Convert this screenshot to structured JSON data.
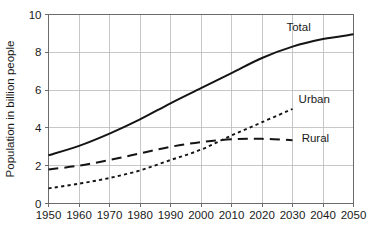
{
  "chart_data": {
    "type": "line",
    "title": "",
    "xlabel": "",
    "ylabel": "Population in billion people",
    "xlim": [
      1950,
      2050
    ],
    "ylim": [
      0,
      10
    ],
    "grid": true,
    "legend_position": "inline-right-of-series",
    "x_ticks": [
      1950,
      1960,
      1970,
      1980,
      1990,
      2000,
      2010,
      2020,
      2030,
      2040,
      2050
    ],
    "y_ticks": [
      0,
      2,
      4,
      6,
      8,
      10
    ],
    "x_tick_labels": [
      "1950",
      "1960",
      "1970",
      "1980",
      "1990",
      "2000",
      "2010",
      "2020",
      "2030",
      "2040",
      "2050"
    ],
    "y_tick_labels": [
      "0",
      "2",
      "4",
      "6",
      "8",
      "10"
    ],
    "x": [
      1950,
      1960,
      1970,
      1980,
      1990,
      2000,
      2010,
      2020,
      2030,
      2040,
      2050
    ],
    "series": [
      {
        "name": "Total",
        "label": "Total",
        "style": "solid",
        "label_x": 2028,
        "label_y": 9.35,
        "values": [
          2.55,
          3.05,
          3.7,
          4.45,
          5.3,
          6.1,
          6.9,
          7.7,
          8.3,
          8.7,
          8.95
        ]
      },
      {
        "name": "Urban",
        "label": "Urban",
        "style": "dotted",
        "label_x": 2032,
        "label_y": 5.55,
        "values": [
          0.8,
          1.05,
          1.35,
          1.75,
          2.3,
          2.85,
          3.6,
          4.3,
          5.0,
          null,
          null
        ]
      },
      {
        "name": "Rural",
        "label": "Rural",
        "style": "dashed",
        "label_x": 2033,
        "label_y": 3.45,
        "values": [
          1.8,
          2.0,
          2.3,
          2.65,
          3.0,
          3.25,
          3.4,
          3.42,
          3.35,
          null,
          null
        ]
      }
    ],
    "annotations": [
      {
        "text": "Urban and Rural curves cross near 2007 at about 3.45 billion"
      }
    ],
    "colors": {
      "line": "#141414",
      "grid": "#b9b9b9",
      "frame": "#6b6b6b",
      "text": "#1a1a1a",
      "background": "#ffffff"
    }
  }
}
